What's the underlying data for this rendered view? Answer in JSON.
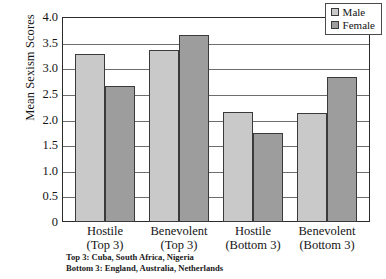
{
  "chart_data": {
    "type": "bar",
    "title": "",
    "xlabel": "",
    "ylabel": "Mean Sexism Scores",
    "categories": [
      {
        "line1": "Hostile",
        "line2": "(Top 3)"
      },
      {
        "line1": "Benevolent",
        "line2": "(Top 3)"
      },
      {
        "line1": "Hostile",
        "line2": "(Bottom 3)"
      },
      {
        "line1": "Benevolent",
        "line2": "(Bottom 3)"
      }
    ],
    "series": [
      {
        "name": "Male",
        "color": "#c9c9c9",
        "values": [
          3.27,
          3.36,
          2.15,
          2.13
        ]
      },
      {
        "name": "Female",
        "color": "#9d9d9d",
        "values": [
          2.65,
          3.65,
          1.73,
          2.83
        ]
      }
    ],
    "ylim": [
      0,
      4.0
    ],
    "yticks": [
      "4.0",
      "3.5",
      "3.0",
      "2.5",
      "2.0",
      "1.5",
      "1.0",
      "0.5",
      "0"
    ],
    "ytick_values": [
      4.0,
      3.5,
      3.0,
      2.5,
      2.0,
      1.5,
      1.0,
      0.5,
      0
    ],
    "grid": true,
    "legend_position": "top-right"
  },
  "legend": {
    "items": [
      {
        "label": "Male",
        "series": "male"
      },
      {
        "label": "Female",
        "series": "female"
      }
    ]
  },
  "footnotes": [
    "Top 3: Cuba, South Africa, Nigeria",
    "Bottom 3: England, Australia, Netherlands"
  ]
}
